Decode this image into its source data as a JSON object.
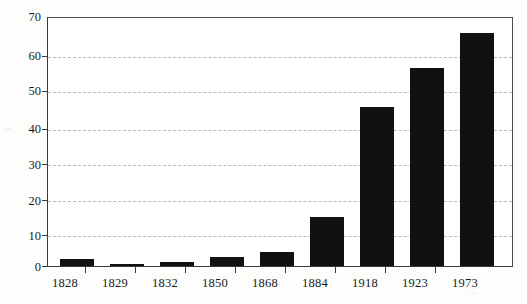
{
  "chart_data": {
    "type": "bar",
    "title": "",
    "subtitle": "",
    "xlabel": "",
    "ylabel": "",
    "categories": [
      "1828",
      "1829",
      "1832",
      "1850",
      "1868",
      "1884",
      "1918",
      "1923",
      "1973"
    ],
    "values": [
      2,
      0.5,
      1,
      2.5,
      4,
      14,
      45,
      56,
      66
    ],
    "ylim": [
      0,
      70
    ],
    "y_ticks": [
      0,
      10,
      20,
      30,
      40,
      50,
      60,
      70
    ],
    "y_tick_labels": [
      "0",
      "10",
      "20",
      "30",
      "40",
      "50",
      "60",
      "70"
    ],
    "grid": true,
    "grid_style": "dashed",
    "legend": null,
    "legend_position": "none",
    "bar_color": "#111111",
    "axis_color": "#3a3a3a",
    "grid_color": "#b9b9b9",
    "background_color": "#ffffff",
    "annotations": []
  }
}
